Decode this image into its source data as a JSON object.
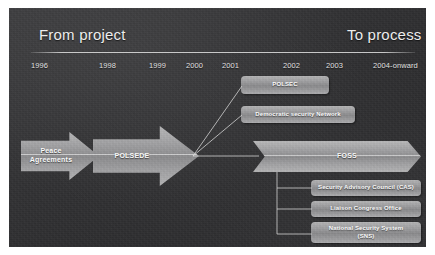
{
  "slide": {
    "title_left": "From project",
    "title_right": "To process",
    "background_color": "#333335",
    "accent_color": "#a0a0a2",
    "text_color": "#ededed"
  },
  "timeline": {
    "years": [
      {
        "label": "1996",
        "x": 22
      },
      {
        "label": "1998",
        "x": 90
      },
      {
        "label": "1999",
        "x": 140
      },
      {
        "label": "2000",
        "x": 177
      },
      {
        "label": "2001",
        "x": 213
      },
      {
        "label": "2002",
        "x": 274
      },
      {
        "label": "2003",
        "x": 317
      },
      {
        "label": "2004-onward",
        "x": 364
      }
    ]
  },
  "arrows": [
    {
      "id": "peace",
      "label": "Peace\nAgreements"
    },
    {
      "id": "polsede",
      "label": "POLSEDE"
    },
    {
      "id": "foss",
      "label": "FOSS"
    }
  ],
  "arrow_labels": {
    "peace_line1": "Peace",
    "peace_line2": "Agreements",
    "polsede": "POLSEDE",
    "foss": "FOSS"
  },
  "boxes": {
    "polsec": "POLSEC",
    "democratic_security_network": "Democratic security Network",
    "security_advisory_council": "Security Advisory Council (CAS)",
    "liaison_congress_office": "Liaison Congress Office",
    "national_security_system_line1": "National Security System",
    "national_security_system_line2": "(SNS)"
  }
}
